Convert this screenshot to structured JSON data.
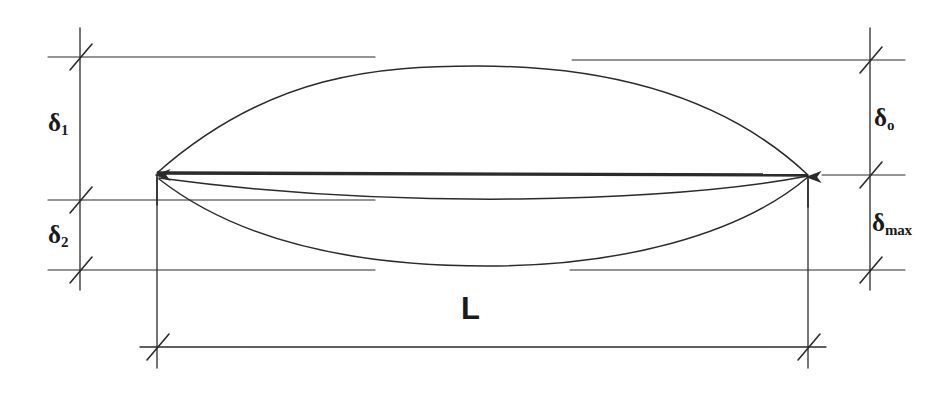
{
  "diagram": {
    "stroke_color": "#2b2b2b",
    "background_color": "#ffffff",
    "labels": {
      "delta1": {
        "symbol": "δ",
        "subscript": "1",
        "name": "delta-one"
      },
      "delta2": {
        "symbol": "δ",
        "subscript": "2",
        "name": "delta-two"
      },
      "delta0": {
        "symbol": "δ",
        "subscript": "o",
        "name": "delta-zero"
      },
      "deltamax": {
        "symbol": "δ",
        "subscript": "max",
        "name": "delta-max"
      },
      "span": "L"
    },
    "geometry": {
      "left_node": {
        "x": 157,
        "y": 173
      },
      "right_node": {
        "x": 808,
        "y": 175
      },
      "upper_curve_apex": {
        "x": 478,
        "y": 66
      },
      "middle_curve_low": {
        "x": 500,
        "y": 198
      },
      "lower_curve_low": {
        "x": 487,
        "y": 266
      },
      "left_dim_axis_x": 80,
      "right_dim_axis_x": 870,
      "top_extension_y": 57,
      "mid_extension_y": 200,
      "bottom_extension_y": 270,
      "span_dim_y": 347
    }
  }
}
